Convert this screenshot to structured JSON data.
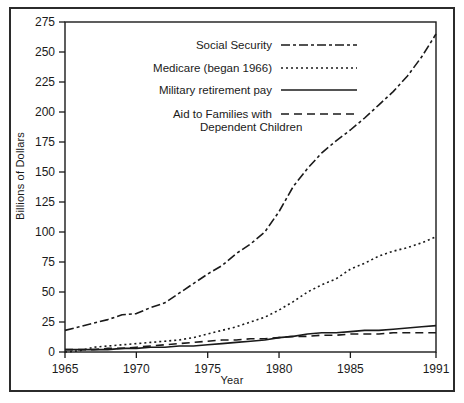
{
  "chart_data": {
    "type": "line",
    "title": "",
    "xlabel": "Year",
    "ylabel": "Billions of Dollars",
    "xlim": [
      1965,
      1991
    ],
    "ylim": [
      0,
      275
    ],
    "xticks": [
      "1965",
      "1970",
      "1975",
      "1980",
      "1985",
      "1991"
    ],
    "xtick_values": [
      1965,
      1970,
      1975,
      1980,
      1985,
      1991
    ],
    "yticks": [
      "0",
      "25",
      "50",
      "75",
      "100",
      "125",
      "150",
      "175",
      "200",
      "225",
      "250",
      "275"
    ],
    "ytick_values": [
      0,
      25,
      50,
      75,
      100,
      125,
      150,
      175,
      200,
      225,
      250,
      275
    ],
    "grid": false,
    "legend_position": "upper-left-inside",
    "x": [
      1965,
      1966,
      1967,
      1968,
      1969,
      1970,
      1971,
      1972,
      1973,
      1974,
      1975,
      1976,
      1977,
      1978,
      1979,
      1980,
      1981,
      1982,
      1983,
      1984,
      1985,
      1986,
      1987,
      1988,
      1989,
      1990,
      1991
    ],
    "series": [
      {
        "name": "Social Security",
        "style": "dash-dot",
        "values": [
          18,
          21,
          24,
          27,
          31,
          32,
          37,
          41,
          49,
          57,
          65,
          72,
          82,
          90,
          100,
          117,
          138,
          153,
          166,
          176,
          185,
          195,
          206,
          217,
          230,
          246,
          265
        ]
      },
      {
        "name": "Medicare (began 1966)",
        "style": "dotted",
        "values": [
          0,
          1,
          4,
          5,
          6,
          7,
          8,
          9,
          10,
          12,
          15,
          18,
          21,
          25,
          29,
          35,
          42,
          50,
          56,
          61,
          69,
          74,
          80,
          84,
          87,
          91,
          96
        ]
      },
      {
        "name": "Military retirement pay",
        "style": "solid",
        "values": [
          2,
          2,
          2,
          2,
          3,
          3,
          4,
          4,
          5,
          5,
          6,
          7,
          8,
          9,
          10,
          12,
          13,
          15,
          16,
          16,
          17,
          18,
          18,
          19,
          20,
          21,
          22
        ]
      },
      {
        "name": "Aid to Families with Dependent Children",
        "style": "dashed",
        "values": [
          2,
          2,
          2,
          3,
          3,
          4,
          5,
          6,
          7,
          8,
          9,
          10,
          10,
          11,
          11,
          12,
          13,
          13,
          14,
          14,
          15,
          15,
          15,
          16,
          16,
          16,
          16
        ]
      }
    ],
    "legend_entries": [
      {
        "label": "Social Security",
        "style": "dash-dot"
      },
      {
        "label": "Medicare (began 1966)",
        "style": "dotted"
      },
      {
        "label": "Military retirement pay",
        "style": "solid"
      },
      {
        "label_line1": "Aid to Families with",
        "label_line2": "Dependent Children",
        "style": "dashed"
      }
    ],
    "colors": {
      "line": "#1a1a1a",
      "axis": "#1a1a1a",
      "text": "#1a1a1a",
      "frame": "#2b2b2b",
      "background": "#ffffff"
    }
  }
}
